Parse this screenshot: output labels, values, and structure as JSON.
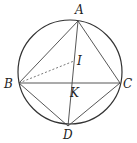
{
  "diagram": {
    "type": "geometry",
    "stroke_color": "#333333",
    "circle": {
      "cx": 70,
      "cy": 72,
      "r": 52
    },
    "points": {
      "A": {
        "label": "A",
        "x": 78,
        "y": 21
      },
      "B": {
        "label": "B",
        "x": 19,
        "y": 83
      },
      "C": {
        "label": "C",
        "x": 120,
        "y": 83
      },
      "D": {
        "label": "D",
        "x": 68,
        "y": 126
      },
      "I": {
        "label": "I",
        "x": 74,
        "y": 61
      },
      "K": {
        "label": "K",
        "x": 72,
        "y": 83
      }
    },
    "segments": [
      {
        "from": "A",
        "to": "B",
        "style": "solid"
      },
      {
        "from": "A",
        "to": "C",
        "style": "solid"
      },
      {
        "from": "B",
        "to": "C",
        "style": "solid"
      },
      {
        "from": "B",
        "to": "D",
        "style": "solid"
      },
      {
        "from": "C",
        "to": "D",
        "style": "solid"
      },
      {
        "from": "A",
        "to": "D",
        "style": "solid"
      },
      {
        "from": "B",
        "to": "I",
        "style": "dashed"
      }
    ]
  }
}
